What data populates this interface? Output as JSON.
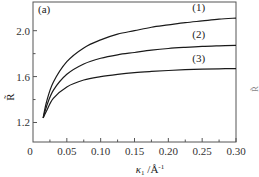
{
  "chart_data": {
    "type": "line",
    "panel_label": "(a)",
    "title": "",
    "xlabel": "κ₁ /Å⁻¹",
    "xlabel_parts": {
      "symbol": "κ",
      "subscript": "1",
      "unit": "/Å",
      "unit_sup": "-1"
    },
    "ylabel": "R̃",
    "xlim": [
      0,
      0.3
    ],
    "ylim": [
      1.03,
      2.25
    ],
    "x_ticks": [
      0,
      0.05,
      0.1,
      0.15,
      0.2,
      0.25,
      0.3
    ],
    "x_tick_labels": [
      "0",
      "0.05",
      "0.10",
      "0.15",
      "0.20",
      "0.25",
      "0.30"
    ],
    "x_minor_ticks": [
      0.025,
      0.075,
      0.125,
      0.175,
      0.225,
      0.275
    ],
    "y_ticks": [
      1.2,
      1.6,
      2.0
    ],
    "y_tick_labels": [
      "1.2",
      "1.6",
      "2.0"
    ],
    "y_minor_ticks": [
      1.4,
      1.8
    ],
    "grid": false,
    "legend": "inline labels (1),(2),(3) above curves at right",
    "x": [
      0.015,
      0.02,
      0.03,
      0.05,
      0.075,
      0.1,
      0.125,
      0.15,
      0.175,
      0.2,
      0.225,
      0.25,
      0.275,
      0.3
    ],
    "series": [
      {
        "name": "(1)",
        "label_pos": [
          0.245,
          2.17
        ],
        "values": [
          1.24,
          1.38,
          1.55,
          1.73,
          1.85,
          1.92,
          1.97,
          2.0,
          2.03,
          2.05,
          2.07,
          2.085,
          2.1,
          2.11
        ]
      },
      {
        "name": "(2)",
        "label_pos": [
          0.245,
          1.94
        ],
        "values": [
          1.24,
          1.34,
          1.48,
          1.62,
          1.71,
          1.76,
          1.79,
          1.81,
          1.83,
          1.845,
          1.855,
          1.863,
          1.868,
          1.872
        ]
      },
      {
        "name": "(3)",
        "label_pos": [
          0.245,
          1.73
        ],
        "values": [
          1.24,
          1.3,
          1.41,
          1.51,
          1.57,
          1.6,
          1.62,
          1.635,
          1.645,
          1.653,
          1.66,
          1.665,
          1.668,
          1.67
        ]
      }
    ]
  },
  "clipped_right_text": "R̃"
}
